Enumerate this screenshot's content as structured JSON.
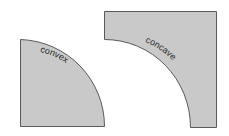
{
  "diagram": {
    "shapes": [
      {
        "id": "convex",
        "label": "convex",
        "fill": "#c9c9c9",
        "stroke": "#5a5a5a"
      },
      {
        "id": "concave",
        "label": "concave",
        "fill": "#c9c9c9",
        "stroke": "#5a5a5a"
      }
    ]
  }
}
